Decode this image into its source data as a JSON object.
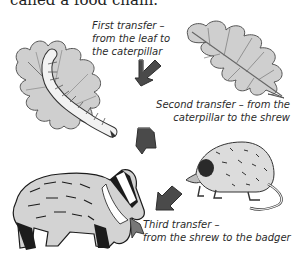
{
  "intro_text": "called a food chain.",
  "transfers": [
    {
      "lines": [
        "First transfer –",
        "from the leaf to",
        "the caterpillar"
      ],
      "from": "leaf",
      "to": "caterpillar"
    },
    {
      "lines": [
        "Second transfer – from the",
        "caterpillar to the shrew"
      ],
      "from": "caterpillar",
      "to": "shrew"
    },
    {
      "lines": [
        "Third transfer –",
        "from the shrew to the badger"
      ],
      "from": "shrew",
      "to": "badger"
    }
  ],
  "organisms": [
    "oak leaf",
    "caterpillar",
    "shrew",
    "badger"
  ],
  "colors": {
    "arrow": "#4a4a4a",
    "arrow_shade": "#2e2e2e",
    "leaf_fill": "#c9c9c9",
    "fur_fill": "#d6d6d6",
    "ink": "#1c1c1c"
  }
}
